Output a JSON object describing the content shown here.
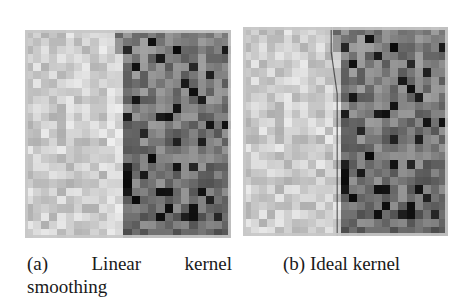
{
  "figure": {
    "panels": [
      {
        "id": "a",
        "caption_label": "(a)",
        "caption_words": [
          "Linear",
          "kernel"
        ],
        "caption_line2": "smoothing",
        "caption_full": "(a) Linear kernel smoothing",
        "grid": {
          "cols": 25,
          "rows": 25,
          "seed": 7,
          "boundary_col": 11,
          "boundary_type": "smooth"
        }
      },
      {
        "id": "b",
        "caption_full": "(b) Ideal kernel",
        "grid": {
          "cols": 25,
          "rows": 25,
          "seed": 7,
          "boundary_col": 11,
          "boundary_type": "sharp"
        }
      }
    ],
    "colors": {
      "light_region_base": "#d2d2d2",
      "dark_region_base": "#7a7a7a",
      "darkest_cell": "#111111",
      "background": "#ffffff"
    }
  }
}
